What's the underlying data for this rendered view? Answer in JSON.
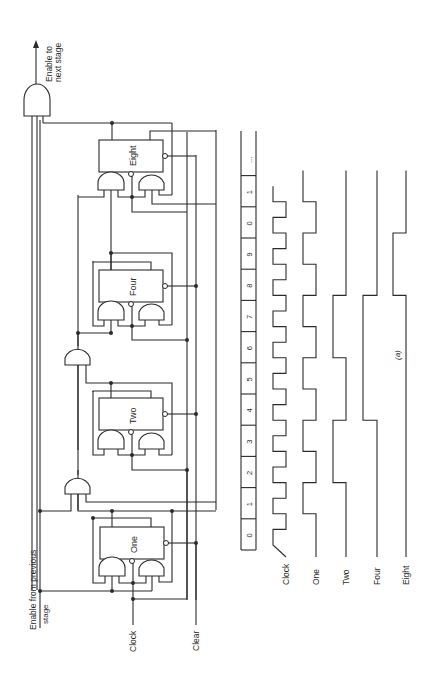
{
  "figure": {
    "caption": "(a)",
    "orientation": "rotated 90° counter-clockwise",
    "line_color": "#2b2b2b",
    "background": "#ffffff"
  },
  "circuit": {
    "inputs": {
      "enable_prev": "Enable from previous",
      "enable_prev_line2": "stage",
      "clock": "Clock",
      "clear": "Clear"
    },
    "output": {
      "enable_next": "Enable to",
      "enable_next_line2": "next stage"
    },
    "flipflops": [
      {
        "label": "One"
      },
      {
        "label": "Two"
      },
      {
        "label": "Four"
      },
      {
        "label": "Eight"
      }
    ]
  },
  "timing": {
    "counts": [
      "0",
      "1",
      "2",
      "3",
      "4",
      "5",
      "6",
      "7",
      "8",
      "9",
      "0",
      "1",
      "..."
    ],
    "signals": [
      {
        "name": "Clock",
        "levels": [
          1,
          0,
          1,
          0,
          1,
          0,
          1,
          0,
          1,
          0,
          1,
          0,
          1,
          0,
          1,
          0,
          1,
          0,
          1,
          0,
          1,
          0,
          1
        ]
      },
      {
        "name": "One",
        "levels": [
          0,
          1,
          0,
          1,
          0,
          1,
          0,
          1,
          0,
          1,
          0,
          1
        ]
      },
      {
        "name": "Two",
        "levels": [
          0,
          0,
          1,
          1,
          0,
          0,
          1,
          1,
          0,
          0,
          0,
          0
        ]
      },
      {
        "name": "Four",
        "levels": [
          0,
          0,
          0,
          0,
          1,
          1,
          1,
          1,
          0,
          0,
          0,
          0
        ]
      },
      {
        "name": "Eight",
        "levels": [
          0,
          0,
          0,
          0,
          0,
          0,
          0,
          0,
          1,
          1,
          0,
          0
        ]
      }
    ]
  }
}
